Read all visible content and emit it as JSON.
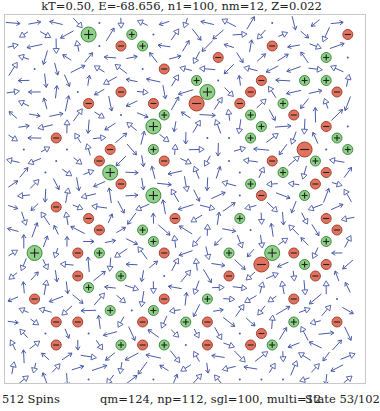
{
  "header": {
    "title": "kT=0.50, E=-68.656, n1=100, nm=12, Z=0.022"
  },
  "lattice": {
    "cols": 16,
    "rows": 32,
    "origin_x": 8,
    "origin_y": 8,
    "col_pitch": 21.6,
    "row_pitch": 11.5,
    "odd_row_offset": 10.8,
    "arrow_color": "#4a5aa8",
    "positive_fill": "#8fd08a",
    "positive_stroke": "#3e8c3a",
    "negative_fill": "#e0735f",
    "negative_stroke": "#a5402f",
    "charges": [
      {
        "r": 1,
        "c": 3,
        "sign": "+",
        "size": "large"
      },
      {
        "r": 1,
        "c": 5,
        "sign": "+",
        "size": "small"
      },
      {
        "r": 1,
        "c": 15,
        "sign": "-",
        "size": "small"
      },
      {
        "r": 2,
        "c": 5,
        "sign": "-",
        "size": "small"
      },
      {
        "r": 2,
        "c": 6,
        "sign": "+",
        "size": "small"
      },
      {
        "r": 2,
        "c": 12,
        "sign": "-",
        "size": "small"
      },
      {
        "r": 3,
        "c": 9,
        "sign": "-",
        "size": "small"
      },
      {
        "r": 3,
        "c": 14,
        "sign": "+",
        "size": "small"
      },
      {
        "r": 4,
        "c": 7,
        "sign": "-",
        "size": "small"
      },
      {
        "r": 5,
        "c": 13,
        "sign": "+",
        "size": "small"
      },
      {
        "r": 5,
        "c": 14,
        "sign": "+",
        "size": "small"
      },
      {
        "r": 5,
        "c": 8,
        "sign": "+",
        "size": "small"
      },
      {
        "r": 5,
        "c": 11,
        "sign": "-",
        "size": "small"
      },
      {
        "r": 6,
        "c": 5,
        "sign": "-",
        "size": "small"
      },
      {
        "r": 6,
        "c": 9,
        "sign": "+",
        "size": "large"
      },
      {
        "r": 6,
        "c": 11,
        "sign": "-",
        "size": "small"
      },
      {
        "r": 6,
        "c": 15,
        "sign": "-",
        "size": "small"
      },
      {
        "r": 7,
        "c": 3,
        "sign": "-",
        "size": "small"
      },
      {
        "r": 7,
        "c": 6,
        "sign": "-",
        "size": "small"
      },
      {
        "r": 7,
        "c": 8,
        "sign": "-",
        "size": "large"
      },
      {
        "r": 7,
        "c": 10,
        "sign": "-",
        "size": "small"
      },
      {
        "r": 7,
        "c": 12,
        "sign": "+",
        "size": "small"
      },
      {
        "r": 8,
        "c": 7,
        "sign": "+",
        "size": "small"
      },
      {
        "r": 8,
        "c": 11,
        "sign": "+",
        "size": "small"
      },
      {
        "r": 8,
        "c": 13,
        "sign": "-",
        "size": "small"
      },
      {
        "r": 9,
        "c": 6,
        "sign": "+",
        "size": "large"
      },
      {
        "r": 9,
        "c": 11,
        "sign": "+",
        "size": "small"
      },
      {
        "r": 9,
        "c": 14,
        "sign": "-",
        "size": "small"
      },
      {
        "r": 10,
        "c": 2,
        "sign": "-",
        "size": "small"
      },
      {
        "r": 10,
        "c": 11,
        "sign": "+",
        "size": "small"
      },
      {
        "r": 10,
        "c": 15,
        "sign": "+",
        "size": "small"
      },
      {
        "r": 11,
        "c": 4,
        "sign": "-",
        "size": "small"
      },
      {
        "r": 11,
        "c": 6,
        "sign": "+",
        "size": "small"
      },
      {
        "r": 11,
        "c": 13,
        "sign": "-",
        "size": "large"
      },
      {
        "r": 11,
        "c": 15,
        "sign": "+",
        "size": "small"
      },
      {
        "r": 12,
        "c": 4,
        "sign": "-",
        "size": "small"
      },
      {
        "r": 12,
        "c": 7,
        "sign": "-",
        "size": "small"
      },
      {
        "r": 12,
        "c": 12,
        "sign": "-",
        "size": "small"
      },
      {
        "r": 12,
        "c": 14,
        "sign": "+",
        "size": "small"
      },
      {
        "r": 13,
        "c": 4,
        "sign": "+",
        "size": "large"
      },
      {
        "r": 13,
        "c": 12,
        "sign": "+",
        "size": "small"
      },
      {
        "r": 13,
        "c": 14,
        "sign": "-",
        "size": "small"
      },
      {
        "r": 14,
        "c": 5,
        "sign": "-",
        "size": "small"
      },
      {
        "r": 14,
        "c": 11,
        "sign": "+",
        "size": "small"
      },
      {
        "r": 14,
        "c": 14,
        "sign": "-",
        "size": "small"
      },
      {
        "r": 15,
        "c": 6,
        "sign": "+",
        "size": "large"
      },
      {
        "r": 15,
        "c": 11,
        "sign": "-",
        "size": "small"
      },
      {
        "r": 15,
        "c": 13,
        "sign": "+",
        "size": "small"
      },
      {
        "r": 16,
        "c": 2,
        "sign": "-",
        "size": "small"
      },
      {
        "r": 17,
        "c": 3,
        "sign": "-",
        "size": "small"
      },
      {
        "r": 17,
        "c": 7,
        "sign": "-",
        "size": "small"
      },
      {
        "r": 17,
        "c": 10,
        "sign": "+",
        "size": "small"
      },
      {
        "r": 17,
        "c": 14,
        "sign": "-",
        "size": "small"
      },
      {
        "r": 18,
        "c": 4,
        "sign": "-",
        "size": "small"
      },
      {
        "r": 18,
        "c": 6,
        "sign": "+",
        "size": "small"
      },
      {
        "r": 18,
        "c": 15,
        "sign": "-",
        "size": "small"
      },
      {
        "r": 19,
        "c": 6,
        "sign": "+",
        "size": "small"
      },
      {
        "r": 19,
        "c": 14,
        "sign": "+",
        "size": "small"
      },
      {
        "r": 20,
        "c": 1,
        "sign": "+",
        "size": "large"
      },
      {
        "r": 20,
        "c": 3,
        "sign": "-",
        "size": "small"
      },
      {
        "r": 20,
        "c": 4,
        "sign": "+",
        "size": "small"
      },
      {
        "r": 20,
        "c": 7,
        "sign": "-",
        "size": "small"
      },
      {
        "r": 20,
        "c": 10,
        "sign": "+",
        "size": "small"
      },
      {
        "r": 20,
        "c": 12,
        "sign": "+",
        "size": "large"
      },
      {
        "r": 20,
        "c": 13,
        "sign": "-",
        "size": "small"
      },
      {
        "r": 21,
        "c": 11,
        "sign": "-",
        "size": "large"
      },
      {
        "r": 21,
        "c": 13,
        "sign": "+",
        "size": "small"
      },
      {
        "r": 21,
        "c": 14,
        "sign": "-",
        "size": "small"
      },
      {
        "r": 22,
        "c": 3,
        "sign": "-",
        "size": "small"
      },
      {
        "r": 22,
        "c": 5,
        "sign": "+",
        "size": "small"
      },
      {
        "r": 22,
        "c": 10,
        "sign": "-",
        "size": "small"
      },
      {
        "r": 22,
        "c": 14,
        "sign": "-",
        "size": "small"
      },
      {
        "r": 23,
        "c": 3,
        "sign": "+",
        "size": "small"
      },
      {
        "r": 24,
        "c": 1,
        "sign": "-",
        "size": "small"
      },
      {
        "r": 24,
        "c": 7,
        "sign": "-",
        "size": "small"
      },
      {
        "r": 24,
        "c": 9,
        "sign": "+",
        "size": "small"
      },
      {
        "r": 24,
        "c": 13,
        "sign": "-",
        "size": "small"
      },
      {
        "r": 25,
        "c": 4,
        "sign": "+",
        "size": "small"
      },
      {
        "r": 25,
        "c": 6,
        "sign": "+",
        "size": "small"
      },
      {
        "r": 26,
        "c": 2,
        "sign": "-",
        "size": "small"
      },
      {
        "r": 26,
        "c": 3,
        "sign": "-",
        "size": "small"
      },
      {
        "r": 26,
        "c": 6,
        "sign": "-",
        "size": "small"
      },
      {
        "r": 26,
        "c": 8,
        "sign": "+",
        "size": "small"
      },
      {
        "r": 26,
        "c": 9,
        "sign": "-",
        "size": "small"
      },
      {
        "r": 26,
        "c": 13,
        "sign": "+",
        "size": "small"
      },
      {
        "r": 26,
        "c": 15,
        "sign": "-",
        "size": "small"
      },
      {
        "r": 27,
        "c": 11,
        "sign": "-",
        "size": "small"
      },
      {
        "r": 28,
        "c": 2,
        "sign": "-",
        "size": "small"
      },
      {
        "r": 28,
        "c": 5,
        "sign": "+",
        "size": "small"
      },
      {
        "r": 28,
        "c": 6,
        "sign": "-",
        "size": "small"
      },
      {
        "r": 28,
        "c": 7,
        "sign": "+",
        "size": "small"
      },
      {
        "r": 28,
        "c": 9,
        "sign": "-",
        "size": "small"
      },
      {
        "r": 28,
        "c": 11,
        "sign": "-",
        "size": "small"
      },
      {
        "r": 28,
        "c": 12,
        "sign": "+",
        "size": "small"
      }
    ]
  },
  "status": {
    "spins": "512 Spins",
    "counts": "qm=124, np=112, sgl=100, multi=12",
    "state": "State 53/102"
  }
}
